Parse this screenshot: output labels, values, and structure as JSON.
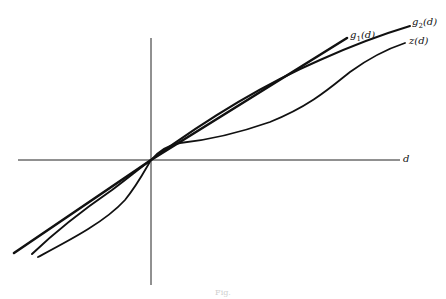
{
  "figure": {
    "type": "function-comparison-diagram",
    "axes": {
      "horizontal_label": "d",
      "vertical_label": "",
      "origin": [
        151,
        160
      ]
    },
    "curves": [
      {
        "id": "g1",
        "name": "g",
        "subscript": "1",
        "arg": "(d)",
        "label": "g1(d)",
        "description": "straight line through origin, steepest"
      },
      {
        "id": "g2",
        "name": "g",
        "subscript": "2",
        "arg": "(d)",
        "label": "g2(d)",
        "description": "through origin, slightly concave above"
      },
      {
        "id": "z",
        "name": "z",
        "subscript": "",
        "arg": "(d)",
        "label": "z(d)",
        "description": "through origin, flattens then rises (S-shaped)"
      }
    ],
    "caption": "Fig."
  },
  "colors": {
    "ink": "#111111",
    "background": "#ffffff"
  }
}
